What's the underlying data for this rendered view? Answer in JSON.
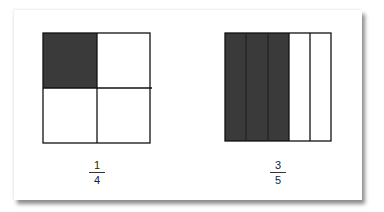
{
  "figures": [
    {
      "id": "quarter-square",
      "shape": "square divided into 2x2 grid",
      "parts": 4,
      "shaded": 1,
      "label": {
        "numerator": "1",
        "denominator": "4"
      }
    },
    {
      "id": "fifths-rectangle",
      "shape": "rectangle divided into 5 vertical strips",
      "parts": 5,
      "shaded": 3,
      "label": {
        "numerator": "3",
        "denominator": "5"
      }
    }
  ],
  "colors": {
    "shaded": "#3a3a3a",
    "outline": "#111111",
    "background": "#ffffff"
  }
}
